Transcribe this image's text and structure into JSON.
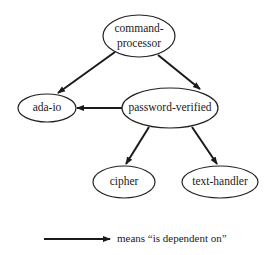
{
  "diagram": {
    "type": "dependency-graph",
    "nodes": [
      {
        "id": "command-processor",
        "lines": [
          "command-",
          "processor"
        ]
      },
      {
        "id": "ada-io",
        "label": "ada-io"
      },
      {
        "id": "password-verified",
        "label": "password-verified"
      },
      {
        "id": "cipher",
        "label": "cipher"
      },
      {
        "id": "text-handler",
        "label": "text-handler"
      }
    ],
    "edges": [
      {
        "from": "command-processor",
        "to": "ada-io"
      },
      {
        "from": "command-processor",
        "to": "password-verified"
      },
      {
        "from": "password-verified",
        "to": "ada-io"
      },
      {
        "from": "password-verified",
        "to": "cipher"
      },
      {
        "from": "password-verified",
        "to": "text-handler"
      }
    ],
    "legend": {
      "text": "means “is dependent on”"
    },
    "colors": {
      "line": "#1a1a1a",
      "background": "#ffffff"
    }
  }
}
